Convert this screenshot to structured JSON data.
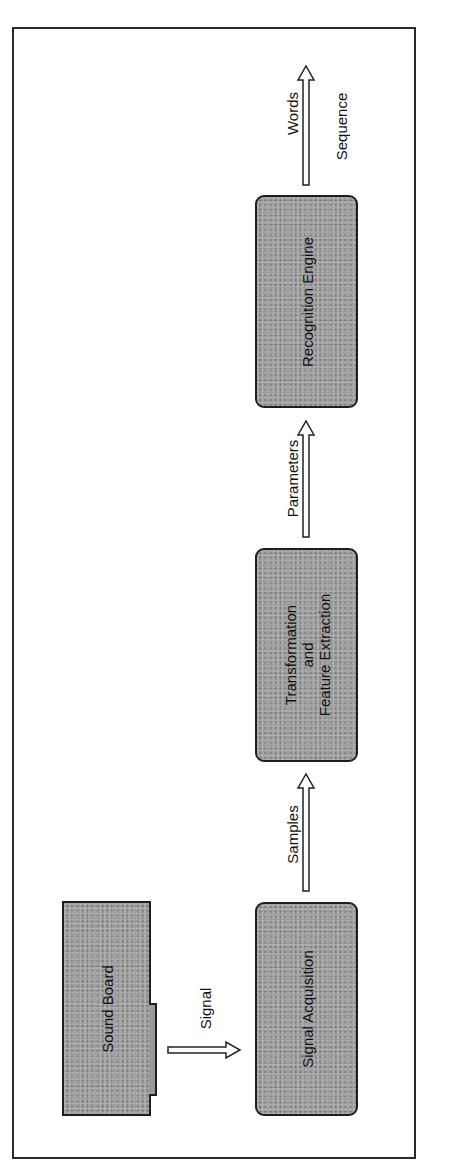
{
  "diagram": {
    "blocks": {
      "sound_board": "Sound Board",
      "signal_acquisition": "Signal Acquisition",
      "transformation": [
        "Transformation",
        "and",
        "Feature Extraction"
      ],
      "recognition_engine": "Recognition Engine"
    },
    "arrows": {
      "signal": "Signal",
      "samples": "Samples",
      "parameters": "Parameters",
      "words": "Words",
      "sequence": "Sequence"
    },
    "colors": {
      "block_fill": "#9a9a9a",
      "border": "#1e1e1e",
      "background": "#ffffff"
    }
  }
}
